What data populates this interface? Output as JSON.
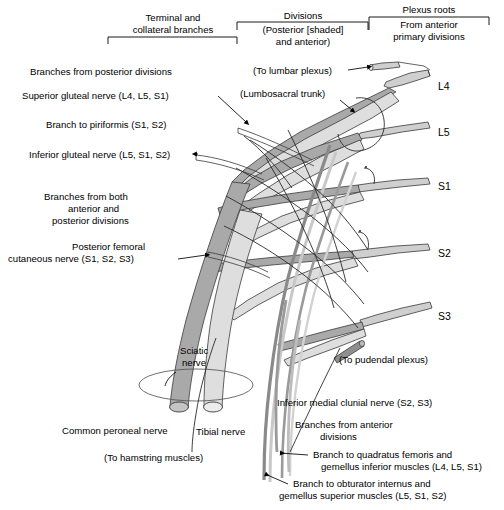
{
  "figure": {
    "colors": {
      "posterior_division_fill": "#a9a9a9",
      "anterior_division_fill": "#dedede",
      "outline": "#3a3a3a",
      "text": "#000000",
      "background": "#ffffff"
    }
  },
  "header": {
    "brackets": [
      {
        "id": "terminal-collateral",
        "lines": [
          "Terminal and",
          "collateral branches"
        ],
        "line1": "Terminal and",
        "line2": "collateral branches"
      },
      {
        "id": "divisions",
        "line1": "Divisions",
        "line2": "(Posterior [shaded]",
        "line3": "and anterior)"
      },
      {
        "id": "plexus-roots",
        "line1": "Plexus roots",
        "line2": "From anterior",
        "line3": "primary divisions"
      }
    ]
  },
  "left_labels": [
    {
      "id": "branches-posterior-divisions",
      "lines": [
        "Branches from posterior divisions"
      ],
      "line1": "Branches from posterior divisions"
    },
    {
      "id": "superior-gluteal-nerve",
      "line1": "Superior gluteal nerve (L4, L5, S1)"
    },
    {
      "id": "branch-to-piriformis",
      "line1": "Branch to piriformis (S1, S2)"
    },
    {
      "id": "inferior-gluteal-nerve",
      "line1": "Inferior gluteal nerve (L5, S1, S2)"
    },
    {
      "id": "branches-both-divisions",
      "line1": "Branches from both",
      "line2": "anterior and",
      "line3": "posterior divisions"
    },
    {
      "id": "posterior-femoral-cutaneous-nerve",
      "line1": "Posterior femoral",
      "line2": "cutaneous nerve (S1, S2, S3)"
    },
    {
      "id": "common-peroneal-nerve",
      "line1": "Common peroneal nerve"
    },
    {
      "id": "to-hamstring-muscles",
      "line1": "(To hamstring muscles)"
    }
  ],
  "center_labels": [
    {
      "id": "to-lumbar-plexus",
      "line1": "(To lumbar plexus)"
    },
    {
      "id": "lumbosacral-trunk",
      "line1": "(Lumbosacral trunk)"
    },
    {
      "id": "sciatic-nerve",
      "line1": "Sciatic",
      "line2": "nerve"
    },
    {
      "id": "tibial-nerve",
      "line1": "Tibial nerve"
    }
  ],
  "right_labels": [
    {
      "id": "to-pudendal-plexus",
      "line1": "(To pudendal plexus)"
    },
    {
      "id": "inferior-medial-clunial-nerve",
      "line1": "Inferior medial clunial nerve (S2, S3)"
    },
    {
      "id": "branches-anterior-divisions",
      "line1": "Branches from anterior",
      "line2": "divisions"
    },
    {
      "id": "branch-quadratus-femoris",
      "line1": "Branch to quadratus femoris and",
      "line2": "gemellus inferior muscles (L4, L5, S1)"
    },
    {
      "id": "branch-obturator-internus",
      "line1": "Branch to obturator internus and",
      "line2": "gemellus superior muscles (L5, S1, S2)"
    }
  ],
  "roots": [
    {
      "id": "root-l4",
      "label": "L4",
      "y": 86
    },
    {
      "id": "root-l5",
      "label": "L5",
      "y": 132
    },
    {
      "id": "root-s1",
      "label": "S1",
      "y": 186
    },
    {
      "id": "root-s2",
      "label": "S2",
      "y": 253
    },
    {
      "id": "root-s3",
      "label": "S3",
      "y": 316
    }
  ]
}
